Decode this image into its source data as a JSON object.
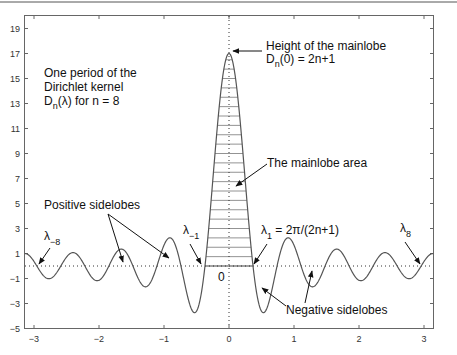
{
  "chart_data": {
    "type": "line",
    "title": "",
    "xlabel": "",
    "ylabel": "",
    "function": "D_n(lambda) = sin((2n+1)lambda/2) / sin(lambda/2)",
    "n": 8,
    "xlim": [
      -3.14159,
      3.14159
    ],
    "ylim": [
      -5,
      20
    ],
    "x_ticks": [
      -3,
      -2,
      -1,
      0,
      1,
      2,
      3
    ],
    "y_ticks": [
      -5,
      -3,
      -1,
      1,
      3,
      5,
      7,
      9,
      11,
      13,
      15,
      17,
      19
    ],
    "grid": false,
    "baseline_y": 0,
    "mainlobe_peak": 17,
    "mainlobe_zeros": [
      -0.3696,
      0.3696
    ],
    "mainlobe_hatched": true,
    "series": [
      {
        "name": "D_8(lambda)",
        "color": "#555555"
      }
    ],
    "annotations": [
      {
        "id": "period",
        "lines": [
          "One period of the",
          "Dirichlet kernel",
          "D_n(λ) for n = 8"
        ]
      },
      {
        "id": "height",
        "lines": [
          "Height of the mainlobe",
          "D_n(0) = 2n+1"
        ]
      },
      {
        "id": "area",
        "lines": [
          "The mainlobe area"
        ]
      },
      {
        "id": "pos",
        "lines": [
          "Positive sidelobes"
        ]
      },
      {
        "id": "neg",
        "lines": [
          "Negative sidelobes"
        ]
      },
      {
        "id": "lam_m8",
        "lines": [
          "λ_-8"
        ]
      },
      {
        "id": "lam_m1",
        "lines": [
          "λ_-1"
        ]
      },
      {
        "id": "lam_1",
        "lines": [
          "λ_1 = 2π/(2n+1)"
        ]
      },
      {
        "id": "lam_8",
        "lines": [
          "λ_8"
        ]
      },
      {
        "id": "zero",
        "lines": [
          "0"
        ]
      }
    ]
  },
  "labels": {
    "period_1": "One period of the",
    "period_2": "Dirichlet kernel",
    "period_3a": "D",
    "period_3s": "n",
    "period_3b": "(λ) for n = 8",
    "height_1": "Height of the mainlobe",
    "height_2a": "D",
    "height_2s": "n",
    "height_2b": "(0) = 2n+1",
    "area": "The mainlobe area",
    "pos": "Positive sidelobes",
    "neg": "Negative sidelobes",
    "lam": "λ",
    "lam_m8_sub": "−8",
    "lam_m1_sub": "−1",
    "lam_1_sub": "1",
    "lam_1_rest": " = 2π/(2n+1)",
    "lam_8_sub": "8",
    "zero": "0"
  }
}
